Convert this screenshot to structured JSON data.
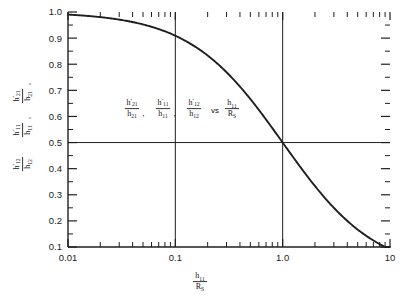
{
  "figure": {
    "kind": "semilog-plot",
    "background": "#ffffff",
    "ink_color": "#1f1f1f"
  },
  "annotation": {
    "text": "h'21/h21, h'11/h11, h'12/h12 vs h11/RS",
    "terms": [
      {
        "num": "h",
        "num_sub": "21",
        "num_prime": true,
        "den": "h",
        "den_sub": "21",
        "sep": ","
      },
      {
        "num": "h",
        "num_sub": "11",
        "num_prime": true,
        "den": "h",
        "den_sub": "11",
        "sep": ","
      },
      {
        "num": "h",
        "num_sub": "12",
        "num_prime": true,
        "den": "h",
        "den_sub": "12",
        "sep": ""
      }
    ],
    "vs_label": "vs",
    "rhs": {
      "num": "h",
      "num_sub": "11",
      "den": "R",
      "den_sub": "S"
    }
  },
  "ylabel": {
    "lines": [
      {
        "num": "h",
        "num_sub": "12",
        "prime": true,
        "den": "h",
        "den_sub": "12",
        "trail": ""
      },
      {
        "num": "h",
        "num_sub": "11",
        "prime": true,
        "den": "h",
        "den_sub": "11",
        "trail": ","
      },
      {
        "num": "h",
        "num_sub": "21",
        "prime": true,
        "den": "h",
        "den_sub": "21",
        "trail": ","
      }
    ]
  },
  "xlabel": {
    "num": "h",
    "num_sub": "11",
    "den": "R",
    "den_sub": "S"
  },
  "chart_data": {
    "type": "line",
    "title": "",
    "xlabel": "h11/RS",
    "ylabel": "h'21/h21, h'11/h11, h'12/h12",
    "xscale": "log",
    "yscale": "linear",
    "xlim": [
      0.01,
      10
    ],
    "ylim": [
      0.1,
      1.0
    ],
    "grid": false,
    "legend": null,
    "x_tick_labels": [
      "0.01",
      "0.1",
      "1.0",
      "10"
    ],
    "x_tick_values": [
      0.01,
      0.1,
      1,
      10
    ],
    "y_tick_labels": [
      "0.1",
      "0.2",
      "0.3",
      "0.4",
      "0.5",
      "0.6",
      "0.7",
      "0.8",
      "0.9",
      "1.0"
    ],
    "y_tick_values": [
      0.1,
      0.2,
      0.3,
      0.4,
      0.5,
      0.6,
      0.7,
      0.8,
      0.9,
      1.0
    ],
    "y_minor_step": 0.05,
    "x_minor_decade_multipliers": [
      2,
      3,
      4,
      5,
      6,
      7,
      8,
      9
    ],
    "reference_lines": [
      {
        "orientation": "vertical",
        "value": 0.1,
        "label": "0.1"
      },
      {
        "orientation": "vertical",
        "value": 1.0,
        "label": "1.0"
      },
      {
        "orientation": "horizontal",
        "value": 0.5,
        "label": "0.5"
      }
    ],
    "series": [
      {
        "name": "1/(1 + h11/RS)",
        "formula": "y = 1/(1+x)",
        "x": [
          0.01,
          0.02,
          0.03,
          0.05,
          0.07,
          0.1,
          0.15,
          0.2,
          0.3,
          0.4,
          0.5,
          0.7,
          1.0,
          1.5,
          2.0,
          3.0,
          4.0,
          5.0,
          7.0,
          10.0
        ],
        "values": [
          0.99,
          0.98,
          0.971,
          0.952,
          0.935,
          0.909,
          0.87,
          0.833,
          0.769,
          0.714,
          0.667,
          0.588,
          0.5,
          0.4,
          0.333,
          0.25,
          0.2,
          0.167,
          0.125,
          0.091
        ]
      }
    ]
  }
}
